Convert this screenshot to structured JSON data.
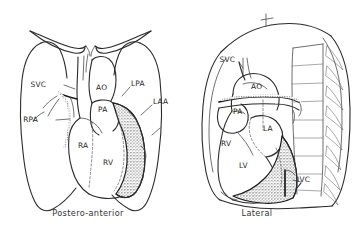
{
  "figure": {
    "background_color": "#ffffff",
    "line_color": "#2b2b2b",
    "stipple_color": "#1a1a1a"
  },
  "panels": [
    {
      "id": "postero-anterior",
      "caption": "Postero-anterior",
      "labels": [
        {
          "key": "svc",
          "text": "SVC",
          "meaning": "superior-vena-cava"
        },
        {
          "key": "ao",
          "text": "AO",
          "meaning": "aorta"
        },
        {
          "key": "lpa",
          "text": "LPA",
          "meaning": "left-pulmonary-artery"
        },
        {
          "key": "pa",
          "text": "PA",
          "meaning": "pulmonary-artery"
        },
        {
          "key": "laa",
          "text": "LAA",
          "meaning": "left-atrial-appendage"
        },
        {
          "key": "rpa",
          "text": "RPA",
          "meaning": "right-pulmonary-artery"
        },
        {
          "key": "ra",
          "text": "RA",
          "meaning": "right-atrium"
        },
        {
          "key": "rv",
          "text": "RV",
          "meaning": "right-ventricle"
        }
      ]
    },
    {
      "id": "lateral",
      "caption": "Lateral",
      "labels": [
        {
          "key": "svc",
          "text": "SVC",
          "meaning": "superior-vena-cava"
        },
        {
          "key": "ao",
          "text": "AO",
          "meaning": "aorta"
        },
        {
          "key": "pa",
          "text": "PA",
          "meaning": "pulmonary-artery"
        },
        {
          "key": "la",
          "text": "LA",
          "meaning": "left-atrium"
        },
        {
          "key": "rv",
          "text": "RV",
          "meaning": "right-ventricle"
        },
        {
          "key": "lv",
          "text": "LV",
          "meaning": "left-ventricle"
        },
        {
          "key": "ivc",
          "text": "IVC",
          "meaning": "inferior-vena-cava"
        }
      ]
    }
  ]
}
